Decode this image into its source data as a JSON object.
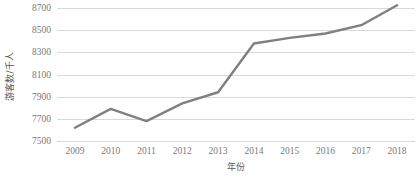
{
  "chart_data": {
    "type": "line",
    "title": "",
    "xlabel": "年份",
    "ylabel": "游客数/千人",
    "categories": [
      "2009",
      "2010",
      "2011",
      "2012",
      "2013",
      "2014",
      "2015",
      "2016",
      "2017",
      "2018"
    ],
    "series": [
      {
        "name": "游客数",
        "values": [
          7620,
          7790,
          7680,
          7840,
          7940,
          8380,
          8430,
          8470,
          8545,
          8725
        ]
      }
    ],
    "ylim": [
      7500,
      8700
    ],
    "ytick_labels": [
      "7500",
      "7700",
      "7900",
      "8100",
      "8300",
      "8500",
      "8700"
    ],
    "ytick_values": [
      7500,
      7700,
      7900,
      8100,
      8300,
      8500,
      8700
    ],
    "grid": "horizontal",
    "legend": "none",
    "line_color": "#808080",
    "gridline_color": "#D9D9D9",
    "text_color": "#7A7A7A",
    "background_color": "#FFFFFF",
    "markers": "none",
    "line_width": 2.4
  }
}
